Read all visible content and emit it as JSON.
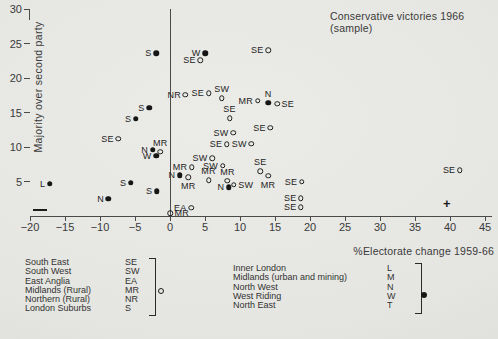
{
  "title": {
    "line1": "Conservative victories 1966",
    "line2": "(sample)"
  },
  "axes": {
    "y_label": "Majority over second party",
    "x_label": "%Electorate change 1959-66",
    "y_ticks": [
      5,
      10,
      15,
      20,
      25,
      30
    ],
    "x_ticks": [
      -20,
      -15,
      -10,
      -5,
      0,
      5,
      10,
      15,
      20,
      25,
      30,
      35,
      40,
      45
    ],
    "minus_symbol": "—",
    "plus_symbol": "+"
  },
  "chart_data": {
    "type": "scatter",
    "title": "Conservative victories 1966 (sample)",
    "xlabel": "%Electorate change 1959-66",
    "ylabel": "Majority over second party",
    "xlim": [
      -20,
      46
    ],
    "ylim": [
      0,
      31
    ],
    "grid": false,
    "series": [
      {
        "name": "Open-circle constituencies (SE, SW, EA, MR, NR, S)",
        "marker": "open",
        "points": [
          {
            "label": "SE",
            "x": 4.3,
            "y": 22.6,
            "label_pos": "left"
          },
          {
            "label": "SE",
            "x": 14.0,
            "y": 24.0,
            "label_pos": "left"
          },
          {
            "label": "NR",
            "x": 2.2,
            "y": 17.6,
            "label_pos": "left"
          },
          {
            "label": "SE",
            "x": 5.5,
            "y": 17.8,
            "label_pos": "left"
          },
          {
            "label": "SW",
            "x": 7.4,
            "y": 17.1,
            "label_pos": "above"
          },
          {
            "label": "MR",
            "x": 12.5,
            "y": 16.7,
            "label_pos": "left"
          },
          {
            "label": "SE",
            "x": 15.3,
            "y": 16.3,
            "label_pos": "right"
          },
          {
            "label": "SE",
            "x": 8.5,
            "y": 14.2,
            "label_pos": "above"
          },
          {
            "label": "SW",
            "x": 9.0,
            "y": 12.1,
            "label_pos": "left"
          },
          {
            "label": "SE",
            "x": 14.3,
            "y": 12.8,
            "label_pos": "left"
          },
          {
            "label": "SE",
            "x": 8.1,
            "y": 10.4,
            "label_pos": "left"
          },
          {
            "label": "SW",
            "x": 11.6,
            "y": 10.5,
            "label_pos": "left"
          },
          {
            "label": "SE",
            "x": -7.4,
            "y": 11.2,
            "label_pos": "left"
          },
          {
            "label": "MR",
            "x": -1.4,
            "y": 9.3,
            "label_pos": "above"
          },
          {
            "label": "SW",
            "x": 6.0,
            "y": 8.4,
            "label_pos": "left"
          },
          {
            "label": "MR",
            "x": 3.1,
            "y": 7.1,
            "label_pos": "left"
          },
          {
            "label": "SW",
            "x": 7.5,
            "y": 7.3,
            "label_pos": "left"
          },
          {
            "label": "MR",
            "x": 2.6,
            "y": 5.6,
            "label_pos": "below"
          },
          {
            "label": "MR",
            "x": 5.5,
            "y": 5.2,
            "label_pos": "above"
          },
          {
            "label": "MR",
            "x": 8.2,
            "y": 5.1,
            "label_pos": "above"
          },
          {
            "label": "SE",
            "x": 12.9,
            "y": 6.5,
            "label_pos": "above"
          },
          {
            "label": "SW",
            "x": 9.1,
            "y": 4.5,
            "label_pos": "right"
          },
          {
            "label": "MR",
            "x": 14.0,
            "y": 5.8,
            "label_pos": "below"
          },
          {
            "label": "SE",
            "x": 18.8,
            "y": 5.0,
            "label_pos": "left"
          },
          {
            "label": "SE",
            "x": 18.7,
            "y": 2.6,
            "label_pos": "left"
          },
          {
            "label": "SE",
            "x": 18.7,
            "y": 1.3,
            "label_pos": "left"
          },
          {
            "label": "EA",
            "x": 3.0,
            "y": 1.2,
            "label_pos": "left"
          },
          {
            "label": "MR",
            "x": 0.0,
            "y": 0.4,
            "label_pos": "right"
          },
          {
            "label": "SE",
            "x": 41.4,
            "y": 6.6,
            "label_pos": "left"
          }
        ]
      },
      {
        "name": "Filled-dot constituencies (L, M, N, W, T)",
        "marker": "filled",
        "points": [
          {
            "label": "S",
            "x": -2.0,
            "y": 23.6,
            "label_pos": "left"
          },
          {
            "label": "W",
            "x": 5.0,
            "y": 23.6,
            "label_pos": "left"
          },
          {
            "label": "N",
            "x": 14.0,
            "y": 16.4,
            "label_pos": "above"
          },
          {
            "label": "S",
            "x": -3.0,
            "y": 15.7,
            "label_pos": "left"
          },
          {
            "label": "S",
            "x": -4.9,
            "y": 14.1,
            "label_pos": "left"
          },
          {
            "label": "N",
            "x": -2.5,
            "y": 9.6,
            "label_pos": "left"
          },
          {
            "label": "W",
            "x": -2.0,
            "y": 8.7,
            "label_pos": "left"
          },
          {
            "label": "N",
            "x": 1.4,
            "y": 5.9,
            "label_pos": "left"
          },
          {
            "label": "N",
            "x": 8.4,
            "y": 4.2,
            "label_pos": "left"
          },
          {
            "label": "S",
            "x": -5.6,
            "y": 4.8,
            "label_pos": "left"
          },
          {
            "label": "S",
            "x": -1.9,
            "y": 3.6,
            "label_pos": "left"
          },
          {
            "label": "L",
            "x": -17.2,
            "y": 4.7,
            "label_pos": "left"
          },
          {
            "label": "N",
            "x": -8.8,
            "y": 2.5,
            "label_pos": "left"
          }
        ]
      }
    ]
  },
  "legend": {
    "left_group": {
      "marker": "open-circle",
      "items": [
        {
          "name": "South East",
          "abbr": "SE"
        },
        {
          "name": "South West",
          "abbr": "SW"
        },
        {
          "name": "East Anglia",
          "abbr": "EA"
        },
        {
          "name": "Midlands (Rural)",
          "abbr": "MR"
        },
        {
          "name": "Northern (Rural)",
          "abbr": "NR"
        },
        {
          "name": "London Suburbs",
          "abbr": "S"
        }
      ]
    },
    "right_group": {
      "marker": "filled-circle",
      "items": [
        {
          "name": "Inner London",
          "abbr": "L"
        },
        {
          "name": "Midlands (urban and mining)",
          "abbr": "M"
        },
        {
          "name": "North West",
          "abbr": "N"
        },
        {
          "name": "West Riding",
          "abbr": "W"
        },
        {
          "name": "North East",
          "abbr": "T"
        }
      ]
    }
  },
  "colors": {
    "background": "#e6e6e2",
    "ink": "#2e2e2e",
    "marker": "#161616"
  }
}
